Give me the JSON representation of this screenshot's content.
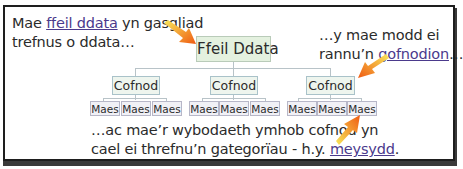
{
  "diagram": {
    "type": "hierarchy",
    "root": {
      "label": "Ffeil Ddata"
    },
    "records": [
      {
        "label": "Cofnod",
        "fields": [
          "Maes",
          "Maes",
          "Maes"
        ]
      },
      {
        "label": "Cofnod",
        "fields": [
          "Maes",
          "Maes",
          "Maes"
        ]
      },
      {
        "label": "Cofnod",
        "fields": [
          "Maes",
          "Maes",
          "Maes"
        ]
      }
    ]
  },
  "annotations": {
    "top_left": {
      "line1_before": "Mae ",
      "line1_link": "ffeil ddata",
      "line1_after": " yn gasgliad",
      "line2": "trefnus o ddata…"
    },
    "top_right": {
      "line1": "…y mae modd ei",
      "line2_before": "rannu’n ",
      "line2_link": "gofnodion",
      "line2_after": "…"
    },
    "bottom": {
      "line1": "…ac mae’r wybodaeth ymhob cofnod yn",
      "line2_before": "cael ei threfnu’n gategorïau - h.y. ",
      "line2_link": "meysydd",
      "line2_after": "."
    }
  },
  "colors": {
    "root_fill": "#e4f1df",
    "record_fill": "#eef5ee",
    "field_fill": "#f1f1f6",
    "link": "#4b3a8c",
    "arrow_start": "#f7e04a",
    "arrow_end": "#f05a14",
    "frame": "#1e1e1e"
  }
}
